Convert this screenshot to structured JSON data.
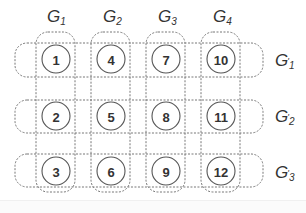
{
  "diagram": {
    "column_groups": [
      {
        "name": "G",
        "sub": "1",
        "members": [
          1,
          2,
          3
        ]
      },
      {
        "name": "G",
        "sub": "2",
        "members": [
          4,
          5,
          6
        ]
      },
      {
        "name": "G",
        "sub": "3",
        "members": [
          7,
          8,
          9
        ]
      },
      {
        "name": "G",
        "sub": "4",
        "members": [
          10,
          11,
          12
        ]
      }
    ],
    "row_groups": [
      {
        "name": "G",
        "prime": "'",
        "sub": "1",
        "members": [
          1,
          4,
          7,
          10
        ]
      },
      {
        "name": "G",
        "prime": "'",
        "sub": "2",
        "members": [
          2,
          5,
          8,
          11
        ]
      },
      {
        "name": "G",
        "prime": "'",
        "sub": "3",
        "members": [
          3,
          6,
          9,
          12
        ]
      }
    ],
    "nodes": [
      {
        "label": "1"
      },
      {
        "label": "4"
      },
      {
        "label": "7"
      },
      {
        "label": "10"
      },
      {
        "label": "2"
      },
      {
        "label": "5"
      },
      {
        "label": "8"
      },
      {
        "label": "11"
      },
      {
        "label": "3"
      },
      {
        "label": "6"
      },
      {
        "label": "9"
      },
      {
        "label": "12"
      }
    ],
    "colors": {
      "stroke": "#555555",
      "dashed": "#777777",
      "text": "#333333"
    }
  }
}
